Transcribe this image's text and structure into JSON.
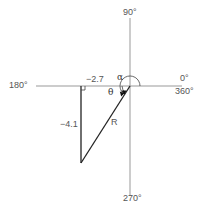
{
  "axes": {
    "top_label": "90°",
    "left_label": "180°",
    "right_label_top": "0°",
    "right_label_bottom": "360°",
    "bottom_label": "270°",
    "axis_color": "#999999"
  },
  "triangle": {
    "horizontal_label": "−2.7",
    "vertical_label": "−4.1",
    "hypotenuse_label": "R",
    "line_color": "#222222"
  },
  "angles": {
    "alpha": "α",
    "theta": "θ"
  }
}
